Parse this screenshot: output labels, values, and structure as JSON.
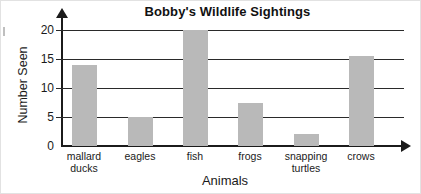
{
  "chart_data": {
    "type": "bar",
    "title": "Bobby's Wildlife Sightings",
    "xlabel": "Animals",
    "ylabel": "Number Seen",
    "categories": [
      "mallard ducks",
      "eagles",
      "fish",
      "frogs",
      "snapping turtles",
      "crows"
    ],
    "category_lines": [
      [
        "mallard",
        "ducks"
      ],
      [
        "eagles",
        ""
      ],
      [
        "fish",
        ""
      ],
      [
        "frogs",
        ""
      ],
      [
        "snapping",
        "turtles"
      ],
      [
        "crows",
        ""
      ]
    ],
    "values": [
      14,
      5,
      20,
      7.5,
      2,
      15.5
    ],
    "ylim": [
      0,
      20
    ],
    "yticks": [
      0,
      5,
      10,
      15,
      20
    ],
    "ytick_labels": [
      "0",
      "5",
      "10",
      "15",
      "20"
    ],
    "grid": "horizontal",
    "legend": "none",
    "bar_color": "#b9b9b9",
    "axis_color": "#1b1b1b",
    "text_color": "#1a1a1a"
  }
}
